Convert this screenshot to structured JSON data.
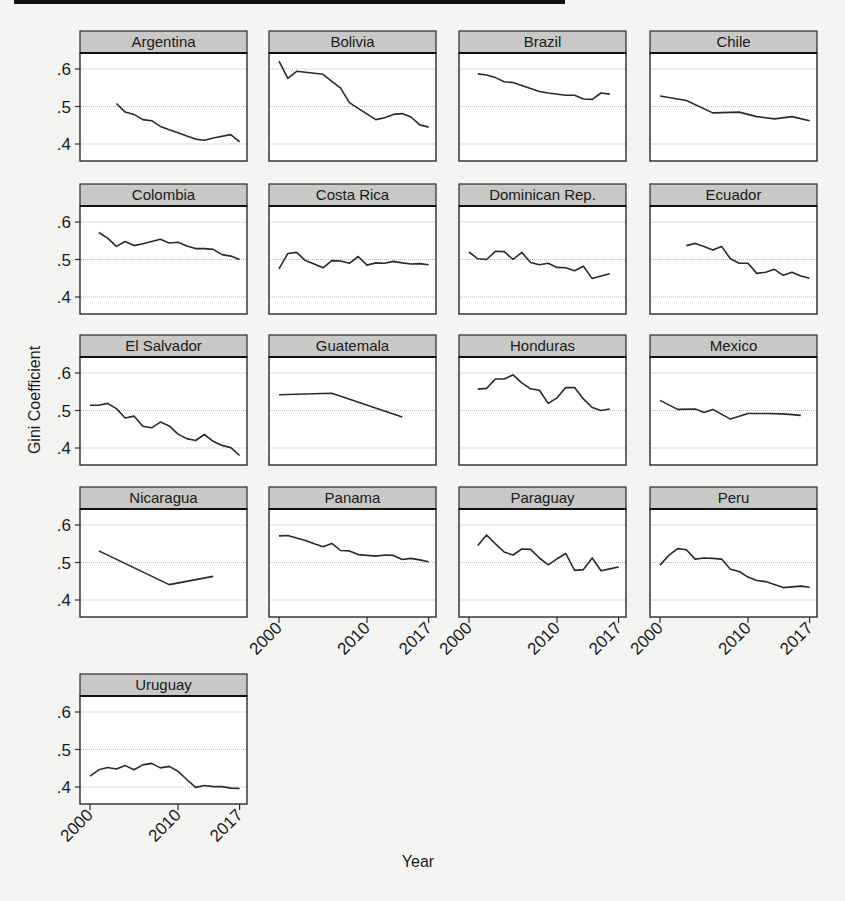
{
  "chart_data": {
    "type": "line",
    "layout": "small-multiples",
    "title": "",
    "xlabel": "Year",
    "ylabel": "Gini Coefficient",
    "ylim": [
      0.355,
      0.645
    ],
    "yticks": [
      0.4,
      0.5,
      0.6
    ],
    "ytick_labels": [
      ".4",
      ".5",
      ".6"
    ],
    "xlim": [
      1998.9,
      2018
    ],
    "xticks": [
      2000,
      2010,
      2017
    ],
    "xtick_labels": [
      "2000",
      "2010",
      "2017"
    ],
    "grid": true,
    "legend": "none",
    "panels": [
      {
        "name": "Argentina",
        "x": [
          2003,
          2004,
          2005,
          2006,
          2007,
          2008,
          2009,
          2010,
          2011,
          2012,
          2013,
          2014,
          2016,
          2017
        ],
        "values": [
          0.508,
          0.485,
          0.479,
          0.465,
          0.462,
          0.447,
          0.438,
          0.43,
          0.421,
          0.413,
          0.41,
          0.416,
          0.425,
          0.406
        ]
      },
      {
        "name": "Bolivia",
        "x": [
          2000,
          2001,
          2002,
          2005,
          2006,
          2007,
          2008,
          2009,
          2011,
          2012,
          2013,
          2014,
          2015,
          2016,
          2017
        ],
        "values": [
          0.621,
          0.575,
          0.594,
          0.586,
          0.567,
          0.549,
          0.51,
          0.495,
          0.465,
          0.47,
          0.479,
          0.481,
          0.472,
          0.451,
          0.445
        ]
      },
      {
        "name": "Brazil",
        "x": [
          2001,
          2002,
          2003,
          2004,
          2005,
          2006,
          2007,
          2008,
          2009,
          2011,
          2012,
          2013,
          2014,
          2015,
          2016
        ],
        "values": [
          0.587,
          0.584,
          0.577,
          0.566,
          0.564,
          0.556,
          0.548,
          0.54,
          0.536,
          0.53,
          0.53,
          0.52,
          0.519,
          0.536,
          0.533
        ]
      },
      {
        "name": "Chile",
        "x": [
          2000,
          2003,
          2006,
          2009,
          2011,
          2013,
          2015,
          2017
        ],
        "values": [
          0.528,
          0.516,
          0.483,
          0.485,
          0.473,
          0.467,
          0.473,
          0.462
        ]
      },
      {
        "name": "Colombia",
        "x": [
          2001,
          2002,
          2003,
          2004,
          2005,
          2006,
          2008,
          2009,
          2010,
          2011,
          2012,
          2013,
          2014,
          2015,
          2016,
          2017
        ],
        "values": [
          0.572,
          0.557,
          0.535,
          0.548,
          0.537,
          0.542,
          0.554,
          0.544,
          0.546,
          0.536,
          0.529,
          0.529,
          0.527,
          0.513,
          0.509,
          0.5
        ]
      },
      {
        "name": "Costa Rica",
        "x": [
          2000,
          2001,
          2002,
          2003,
          2004,
          2005,
          2006,
          2007,
          2008,
          2009,
          2010,
          2011,
          2012,
          2013,
          2014,
          2015,
          2016,
          2017
        ],
        "values": [
          0.475,
          0.516,
          0.519,
          0.497,
          0.488,
          0.478,
          0.497,
          0.496,
          0.49,
          0.508,
          0.485,
          0.491,
          0.49,
          0.495,
          0.491,
          0.488,
          0.489,
          0.486
        ]
      },
      {
        "name": "Dominican Rep.",
        "x": [
          2000,
          2001,
          2002,
          2003,
          2004,
          2005,
          2006,
          2007,
          2008,
          2009,
          2010,
          2011,
          2012,
          2013,
          2014,
          2015,
          2016
        ],
        "values": [
          0.52,
          0.502,
          0.5,
          0.522,
          0.521,
          0.5,
          0.519,
          0.492,
          0.486,
          0.49,
          0.479,
          0.478,
          0.47,
          0.482,
          0.449,
          0.456,
          0.462
        ]
      },
      {
        "name": "Ecuador",
        "x": [
          2003,
          2004,
          2005,
          2006,
          2007,
          2008,
          2009,
          2010,
          2011,
          2012,
          2013,
          2014,
          2015,
          2016,
          2017
        ],
        "values": [
          0.537,
          0.543,
          0.535,
          0.525,
          0.535,
          0.502,
          0.49,
          0.49,
          0.463,
          0.466,
          0.474,
          0.458,
          0.466,
          0.456,
          0.45
        ]
      },
      {
        "name": "El Salvador",
        "x": [
          2000,
          2001,
          2002,
          2003,
          2004,
          2005,
          2006,
          2007,
          2008,
          2009,
          2010,
          2011,
          2012,
          2013,
          2014,
          2015,
          2016,
          2017
        ],
        "values": [
          0.514,
          0.514,
          0.519,
          0.505,
          0.48,
          0.485,
          0.458,
          0.454,
          0.469,
          0.459,
          0.437,
          0.425,
          0.42,
          0.436,
          0.418,
          0.407,
          0.401,
          0.38
        ]
      },
      {
        "name": "Guatemala",
        "x": [
          2000,
          2006,
          2014
        ],
        "values": [
          0.542,
          0.546,
          0.483
        ]
      },
      {
        "name": "Honduras",
        "x": [
          2001,
          2002,
          2003,
          2004,
          2005,
          2006,
          2007,
          2008,
          2009,
          2010,
          2011,
          2012,
          2013,
          2014,
          2015,
          2016
        ],
        "values": [
          0.557,
          0.559,
          0.584,
          0.584,
          0.595,
          0.574,
          0.558,
          0.554,
          0.519,
          0.534,
          0.561,
          0.561,
          0.531,
          0.508,
          0.5,
          0.504
        ]
      },
      {
        "name": "Mexico",
        "x": [
          2000,
          2002,
          2004,
          2005,
          2006,
          2008,
          2010,
          2012,
          2014,
          2016
        ],
        "values": [
          0.527,
          0.503,
          0.504,
          0.495,
          0.503,
          0.477,
          0.492,
          0.492,
          0.491,
          0.487
        ]
      },
      {
        "name": "Nicaragua",
        "x": [
          2001,
          2009,
          2014
        ],
        "values": [
          0.531,
          0.441,
          0.463
        ]
      },
      {
        "name": "Panama",
        "x": [
          2000,
          2001,
          2002,
          2003,
          2004,
          2005,
          2006,
          2007,
          2008,
          2009,
          2010,
          2011,
          2012,
          2013,
          2014,
          2015,
          2016,
          2017
        ],
        "values": [
          0.571,
          0.572,
          0.565,
          0.559,
          0.55,
          0.542,
          0.551,
          0.532,
          0.531,
          0.521,
          0.519,
          0.517,
          0.52,
          0.519,
          0.508,
          0.511,
          0.507,
          0.502
        ]
      },
      {
        "name": "Paraguay",
        "x": [
          2001,
          2002,
          2003,
          2004,
          2005,
          2006,
          2007,
          2008,
          2009,
          2010,
          2011,
          2012,
          2013,
          2014,
          2015,
          2016,
          2017
        ],
        "values": [
          0.545,
          0.573,
          0.55,
          0.528,
          0.52,
          0.536,
          0.535,
          0.512,
          0.494,
          0.51,
          0.524,
          0.479,
          0.481,
          0.512,
          0.478,
          0.483,
          0.488
        ]
      },
      {
        "name": "Peru",
        "x": [
          2000,
          2001,
          2002,
          2003,
          2004,
          2005,
          2006,
          2007,
          2008,
          2009,
          2010,
          2011,
          2012,
          2013,
          2014,
          2015,
          2016,
          2017
        ],
        "values": [
          0.493,
          0.519,
          0.537,
          0.534,
          0.509,
          0.512,
          0.511,
          0.509,
          0.482,
          0.476,
          0.461,
          0.452,
          0.449,
          0.441,
          0.433,
          0.435,
          0.437,
          0.434
        ]
      },
      {
        "name": "Uruguay",
        "x": [
          2000,
          2001,
          2002,
          2003,
          2004,
          2005,
          2006,
          2007,
          2008,
          2009,
          2010,
          2011,
          2012,
          2013,
          2014,
          2015,
          2016,
          2017
        ],
        "values": [
          0.429,
          0.446,
          0.452,
          0.448,
          0.457,
          0.446,
          0.459,
          0.463,
          0.451,
          0.455,
          0.442,
          0.42,
          0.399,
          0.404,
          0.401,
          0.401,
          0.397,
          0.396
        ]
      }
    ]
  },
  "colors": {
    "header_fill": "#c8c8c6",
    "frame": "#2a2a2a",
    "grid": "#b8b8b8",
    "line": "#2a2a2a"
  }
}
